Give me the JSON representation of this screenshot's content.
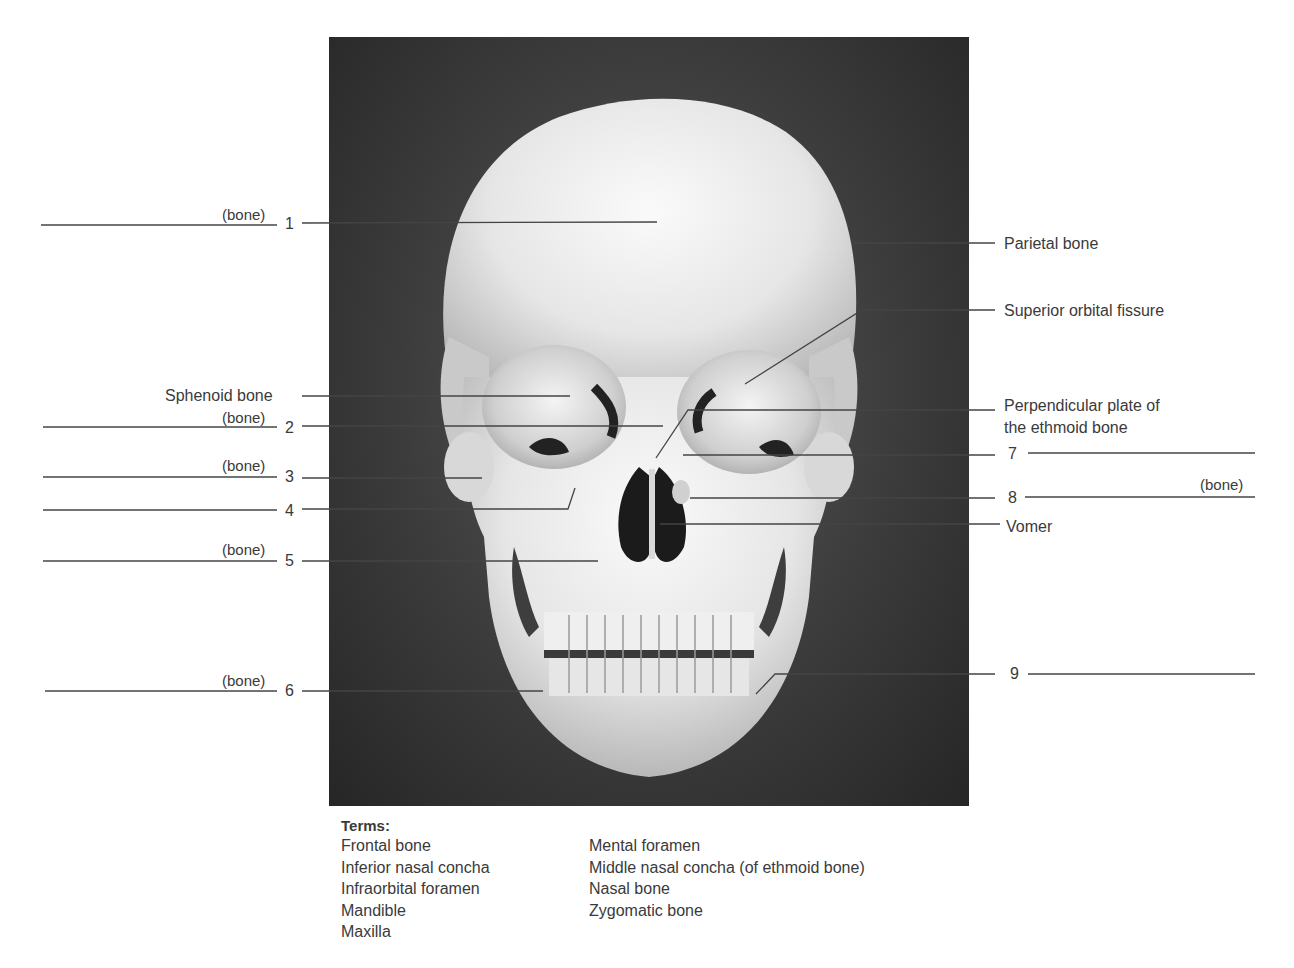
{
  "figure": {
    "colors": {
      "background": "#ffffff",
      "photo_bg": "#3a3a3a",
      "bone": "#ebebeb",
      "line": "#444444",
      "text": "#3a3a3a"
    }
  },
  "left_labels": [
    {
      "number": "1",
      "suffix": "(bone)"
    },
    {
      "text": "Sphenoid bone"
    },
    {
      "number": "2",
      "suffix": "(bone)"
    },
    {
      "number": "3",
      "suffix": "(bone)"
    },
    {
      "number": "4",
      "suffix": ""
    },
    {
      "number": "5",
      "suffix": "(bone)"
    },
    {
      "number": "6",
      "suffix": "(bone)"
    }
  ],
  "right_labels": [
    {
      "text": "Parietal bone"
    },
    {
      "text": "Superior orbital fissure"
    },
    {
      "text_line1": "Perpendicular plate of",
      "text_line2": "the ethmoid bone"
    },
    {
      "number": "7",
      "suffix": ""
    },
    {
      "number": "8",
      "suffix": "(bone)"
    },
    {
      "text": "Vomer"
    },
    {
      "number": "9",
      "suffix": ""
    }
  ],
  "terms": {
    "title": "Terms:",
    "column1": [
      "Frontal bone",
      "Inferior nasal concha",
      "Infraorbital foramen",
      "Mandible",
      "Maxilla"
    ],
    "column2": [
      "Mental foramen",
      "Middle nasal concha (of ethmoid bone)",
      "Nasal bone",
      "Zygomatic bone"
    ]
  }
}
